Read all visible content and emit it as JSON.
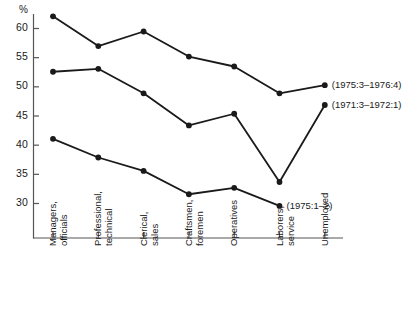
{
  "chart_data": {
    "type": "line",
    "title": "",
    "xlabel": "",
    "ylabel": "%",
    "ylim": [
      27.5,
      63.5
    ],
    "yticks": [
      30,
      35,
      40,
      45,
      50,
      55,
      60
    ],
    "ytick_labels": [
      "30",
      "35",
      "40",
      "45",
      "50",
      "55",
      "60"
    ],
    "grid": false,
    "legend": "none",
    "categories": [
      "Managers, officials",
      "Professional, technical",
      "Clerical, sales",
      "Craftsmen, foremen",
      "Operatives",
      "Laborers, service",
      "Unemployed"
    ],
    "category_lines": [
      [
        "Managers,",
        "officials"
      ],
      [
        "Professional,",
        "technical"
      ],
      [
        "Clerical,",
        "sales"
      ],
      [
        "Craftsmen,",
        "foremen"
      ],
      [
        "Operatives"
      ],
      [
        "Laborers,",
        "service"
      ],
      [
        "Unemployed"
      ]
    ],
    "series": [
      {
        "name": "(1975:3-1976:4)",
        "label": "(1975:3–1976:4)",
        "values": [
          62.0,
          56.9,
          59.4,
          55.1,
          53.4,
          48.8,
          50.2
        ]
      },
      {
        "name": "(1971:3-1972:1)",
        "label": "(1971:3–1972:1)",
        "values": [
          52.5,
          53.0,
          48.8,
          43.3,
          45.3,
          33.6,
          46.8
        ]
      },
      {
        "name": "(1975:1-2)",
        "label": "(1975:1–2)",
        "values": [
          41.0,
          37.8,
          35.5,
          31.5,
          32.6,
          29.5,
          null
        ]
      }
    ],
    "annotations": [
      {
        "text": "(1975:3–1976:4)",
        "series": 0,
        "at_category": "Unemployed"
      },
      {
        "text": "(1971:3–1972:1)",
        "series": 1,
        "at_category": "Unemployed"
      },
      {
        "text": "(1975:1–2)",
        "series": 2,
        "at_category": "Laborers, service"
      }
    ],
    "style": {
      "line_color": "#1a1a1a",
      "marker_color": "#1a1a1a",
      "axis_color": "#555555",
      "background": "#ffffff"
    }
  }
}
